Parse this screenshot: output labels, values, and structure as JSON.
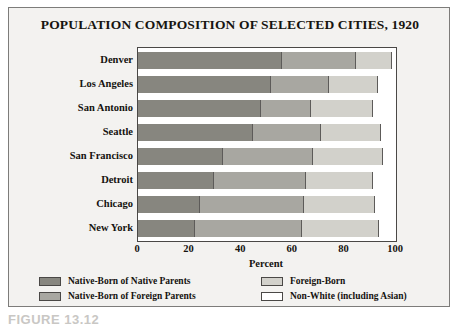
{
  "figure": {
    "title": "POPULATION COMPOSITION OF SELECTED CITIES, 1920",
    "caption": "FIGURE 13.12",
    "xaxis_title": "Percent"
  },
  "colors": {
    "native_born_native_parents": "#87867f",
    "native_born_foreign_parents": "#a8a7a1",
    "foreign_born": "#d2d1cb",
    "non_white": "#ffffff",
    "frame": "#7d7c7a",
    "panel_background": "#f3f2f0",
    "plot_background": "#ffffff",
    "text": "#15130f"
  },
  "legend": {
    "items": [
      {
        "label": "Native-Born of Native Parents",
        "color_key": "native_born_native_parents"
      },
      {
        "label": "Native-Born of Foreign Parents",
        "color_key": "native_born_foreign_parents"
      },
      {
        "label": "Foreign-Born",
        "color_key": "foreign_born"
      },
      {
        "label": "Non-White (including Asian)",
        "color_key": "non_white"
      }
    ]
  },
  "chart_data": {
    "type": "bar",
    "orientation": "horizontal",
    "stacked": true,
    "stack_mode": "percent",
    "title": "POPULATION COMPOSITION OF SELECTED CITIES, 1920",
    "xlabel": "Percent",
    "ylabel": "",
    "xlim": [
      0,
      100
    ],
    "xticks": [
      0,
      20,
      40,
      60,
      80,
      100
    ],
    "xtick_labels": [
      "0",
      "20",
      "40",
      "60",
      "80",
      "100"
    ],
    "grid": false,
    "legend_position": "bottom",
    "categories": [
      "Denver",
      "Los Angeles",
      "San Antonio",
      "Seattle",
      "San Francisco",
      "Detroit",
      "Chicago",
      "New York"
    ],
    "series": [
      {
        "name": "Native-Born of Native Parents",
        "color": "#87867f",
        "values": [
          56,
          51.5,
          47.5,
          44.5,
          33,
          29.5,
          24,
          22
        ]
      },
      {
        "name": "Native-Born of Foreign Parents",
        "color": "#a8a7a1",
        "values": [
          28.5,
          22.5,
          19.5,
          26.5,
          35,
          35.5,
          40.5,
          41.5
        ]
      },
      {
        "name": "Foreign-Born",
        "color": "#d2d1cb",
        "values": [
          14,
          19,
          24,
          23,
          27,
          26,
          27.5,
          30
        ]
      },
      {
        "name": "Non-White (including Asian)",
        "color": "#ffffff",
        "values": [
          1.5,
          7,
          9,
          6,
          5,
          9,
          8,
          6.5
        ]
      }
    ],
    "cumulative_boundaries": {
      "Denver": [
        56,
        84.5,
        98.5,
        100
      ],
      "Los Angeles": [
        51.5,
        74,
        93,
        100
      ],
      "San Antonio": [
        47.5,
        67,
        91,
        100
      ],
      "Seattle": [
        44.5,
        71,
        94,
        100
      ],
      "San Francisco": [
        33,
        68,
        95,
        100
      ],
      "Detroit": [
        29.5,
        65,
        91,
        100
      ],
      "Chicago": [
        24,
        64.5,
        92,
        100
      ],
      "New York": [
        22,
        63.5,
        93.5,
        100
      ]
    }
  }
}
